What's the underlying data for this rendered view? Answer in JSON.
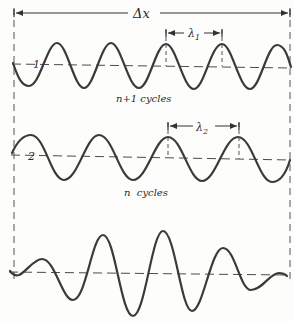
{
  "diagram": {
    "title_label": "Δx",
    "wave1": {
      "axis_label": "1",
      "caption": "n+1 cycles",
      "wavelength_label": "λ",
      "wavelength_sub": "1"
    },
    "wave2": {
      "axis_label": "2",
      "caption": "n  cycles",
      "wavelength_label": "λ",
      "wavelength_sub": "2"
    },
    "wave3": {
      "description": "beat / superposition pattern (envelope)"
    },
    "colors": {
      "ink": "#3a3a3a",
      "background": "#fdfdfc"
    }
  }
}
